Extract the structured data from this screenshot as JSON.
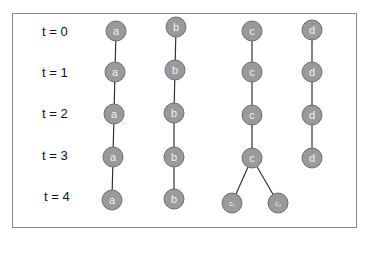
{
  "time_labels": [
    "t = 0",
    "t = 1",
    "t = 2",
    "t = 3",
    "t = 4"
  ],
  "colors": {
    "node_fill": "#9a9a9a",
    "node_stroke": "#6e6e6e",
    "node_text": "#f2f2f2",
    "edge": "#333333",
    "frame": "#8a8a8a"
  },
  "nodes": [
    {
      "id": "a0",
      "label": "a",
      "x": 116,
      "y": 31
    },
    {
      "id": "a1",
      "label": "a",
      "x": 115,
      "y": 72
    },
    {
      "id": "a2",
      "label": "a",
      "x": 114,
      "y": 114
    },
    {
      "id": "a3",
      "label": "a",
      "x": 113,
      "y": 157
    },
    {
      "id": "a4",
      "label": "a",
      "x": 112,
      "y": 200
    },
    {
      "id": "b0",
      "label": "b",
      "x": 176,
      "y": 27
    },
    {
      "id": "b1",
      "label": "b",
      "x": 175,
      "y": 70
    },
    {
      "id": "b2",
      "label": "b",
      "x": 174,
      "y": 113
    },
    {
      "id": "b3",
      "label": "b",
      "x": 174,
      "y": 157
    },
    {
      "id": "b4",
      "label": "b",
      "x": 174,
      "y": 199
    },
    {
      "id": "c0",
      "label": "c",
      "x": 252,
      "y": 31
    },
    {
      "id": "c1",
      "label": "c",
      "x": 252,
      "y": 72
    },
    {
      "id": "c2",
      "label": "c",
      "x": 252,
      "y": 115
    },
    {
      "id": "c3",
      "label": "c",
      "x": 252,
      "y": 158
    },
    {
      "id": "c4a",
      "label": "c₁",
      "x": 232,
      "y": 203
    },
    {
      "id": "c4b",
      "label": "c₂",
      "x": 278,
      "y": 203
    },
    {
      "id": "d0",
      "label": "d",
      "x": 312,
      "y": 30
    },
    {
      "id": "d1",
      "label": "d",
      "x": 312,
      "y": 72
    },
    {
      "id": "d2",
      "label": "d",
      "x": 312,
      "y": 115
    },
    {
      "id": "d3",
      "label": "d",
      "x": 312,
      "y": 158
    }
  ],
  "edges": [
    [
      "a0",
      "a1"
    ],
    [
      "a1",
      "a2"
    ],
    [
      "a2",
      "a3"
    ],
    [
      "a3",
      "a4"
    ],
    [
      "b0",
      "b1"
    ],
    [
      "b1",
      "b2"
    ],
    [
      "b2",
      "b3"
    ],
    [
      "b3",
      "b4"
    ],
    [
      "c0",
      "c1"
    ],
    [
      "c1",
      "c2"
    ],
    [
      "c2",
      "c3"
    ],
    [
      "c3",
      "c4a"
    ],
    [
      "c3",
      "c4b"
    ],
    [
      "d0",
      "d1"
    ],
    [
      "d1",
      "d2"
    ],
    [
      "d2",
      "d3"
    ]
  ]
}
